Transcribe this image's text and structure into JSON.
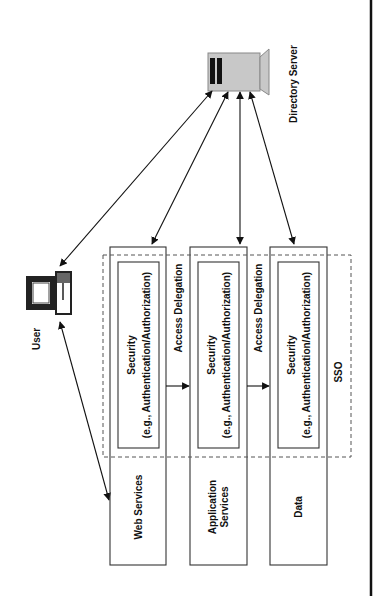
{
  "diagram": {
    "nodes": {
      "user": {
        "label": "User"
      },
      "directory_server": {
        "label": "Directory Server"
      },
      "web_services": {
        "label": "Web Services"
      },
      "application_services": {
        "label_line1": "Application",
        "label_line2": "Services"
      },
      "data": {
        "label": "Data"
      }
    },
    "security_boxes": [
      {
        "line1": "Security",
        "line2": "(e.g., Authentication/Authorization)"
      },
      {
        "line1": "Security",
        "line2": "(e.g., Authentication/Authorization)"
      },
      {
        "line1": "Security",
        "line2": "(e.g., Authentication/Authorization)"
      }
    ],
    "edges": [
      {
        "label": "Access Delegation"
      },
      {
        "label": "Access Delegation"
      }
    ],
    "region": {
      "label": "SSO"
    },
    "colors": {
      "line": "#111111",
      "server_fill": "#c8c8c8",
      "dashed": "#555555"
    }
  }
}
